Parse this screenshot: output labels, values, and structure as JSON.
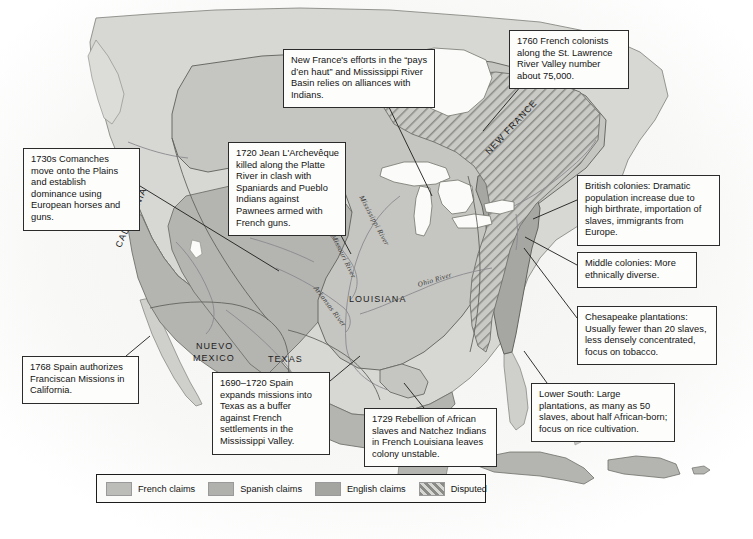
{
  "map": {
    "title": "Colonial North America c. 1700-1760",
    "background_color": "#ffffff",
    "ocean_color": "#f4f4f2",
    "unclaimed_land_color": "#d9d9d5",
    "colors": {
      "french_claims": "#bcbcb8",
      "spanish_claims": "#a8a8a4",
      "english_claims": "#9d9d99",
      "disputed_hatch": "#8f8f8b",
      "border_line": "#6e6e6a",
      "coast_line": "#7a7a76",
      "river_line": "#85858a"
    },
    "region_labels": [
      {
        "name": "CALIFORNIA",
        "text": "CALIFORNIA",
        "x": 118,
        "y": 242,
        "rotate": -66
      },
      {
        "name": "NUEVO MEXICO",
        "text": "NUEVO",
        "x": 196,
        "y": 341,
        "rotate": 0
      },
      {
        "name": "NUEVO MEXICO 2",
        "text": "MEXICO",
        "x": 193,
        "y": 353,
        "rotate": 0
      },
      {
        "name": "TEXAS",
        "text": "TEXAS",
        "x": 268,
        "y": 354,
        "rotate": 0
      },
      {
        "name": "LOUISIANA",
        "text": "LOUISIANA",
        "x": 349,
        "y": 294,
        "rotate": 0
      },
      {
        "name": "NEW FRANCE",
        "text": "NEW FRANCE",
        "x": 487,
        "y": 148,
        "rotate": -47
      }
    ],
    "river_labels": [
      {
        "name": "Mississippi River",
        "text": "Mississippi River",
        "x": 361,
        "y": 192,
        "rotate": 62
      },
      {
        "name": "Missouri River",
        "text": "Missouri River",
        "x": 333,
        "y": 231,
        "rotate": 64
      },
      {
        "name": "Ohio River",
        "text": "Ohio River",
        "x": 418,
        "y": 281,
        "rotate": -17
      },
      {
        "name": "Arkansas River",
        "text": "Arkansas River",
        "x": 315,
        "y": 283,
        "rotate": 53
      }
    ]
  },
  "callouts": [
    {
      "id": "comanches",
      "text": "1730s Comanches move onto the Plains and establish dominance using European horses and guns.",
      "x": 23,
      "y": 148,
      "width": 117,
      "height": 62
    },
    {
      "id": "larcheveque",
      "text": "1720 Jean L'Archevêque killed along the Platte River in clash with Spaniards and Pueblo Indians against Pawnees armed with French guns.",
      "x": 228,
      "y": 142,
      "width": 118,
      "height": 75
    },
    {
      "id": "new-france-efforts",
      "text": "New France's efforts in the  “pays d’en haut” and Mississippi River Basin relies on alliances with Indians.",
      "x": 283,
      "y": 49,
      "width": 152,
      "height": 54
    },
    {
      "id": "french-colonists-1760",
      "text": "1760 French colonists along the St. Lawrence River Valley number about 75,000.",
      "x": 509,
      "y": 30,
      "width": 120,
      "height": 56
    },
    {
      "id": "british-colonies",
      "text": "British colonies: Dramatic population increase due to high birthrate, importation of slaves, immigrants from Europe.",
      "x": 577,
      "y": 175,
      "width": 143,
      "height": 52
    },
    {
      "id": "middle-colonies",
      "text": "Middle colonies: More ethnically diverse.",
      "x": 577,
      "y": 252,
      "width": 120,
      "height": 30
    },
    {
      "id": "chesapeake",
      "text": "Chesapeake plantations: Usually fewer than 20 slaves, less densely concentrated, focus on tobacco.",
      "x": 577,
      "y": 306,
      "width": 140,
      "height": 52
    },
    {
      "id": "lower-south",
      "text": "Lower South: Large plantations, as many as 50 slaves, about half African-born; focus on rice cultivation.",
      "x": 531,
      "y": 383,
      "width": 144,
      "height": 52
    },
    {
      "id": "natchez-rebellion",
      "text": "1729 Rebellion of African slaves and Natchez Indians in French Louisiana leaves colony unstable.",
      "x": 364,
      "y": 408,
      "width": 133,
      "height": 50
    },
    {
      "id": "texas-missions",
      "text": "1690–1720 Spain expands missions into Texas as a buffer against French settlements in the Mississippi Valley.",
      "x": 212,
      "y": 372,
      "width": 118,
      "height": 62
    },
    {
      "id": "franciscan-missions",
      "text": "1768 Spain authorizes Franciscan Missions in California.",
      "x": 22,
      "y": 356,
      "width": 117,
      "height": 40
    }
  ],
  "leader_lines": [
    {
      "id": "comanches-leader",
      "x1": 140,
      "y1": 186,
      "x2": 279,
      "y2": 271
    },
    {
      "id": "larcheveque-leader",
      "x1": 331,
      "y1": 217,
      "x2": 351,
      "y2": 254
    },
    {
      "id": "new-france-leader",
      "x1": 387,
      "y1": 103,
      "x2": 432,
      "y2": 196
    },
    {
      "id": "french-colonists-leader",
      "x1": 521,
      "y1": 86,
      "x2": 483,
      "y2": 131
    },
    {
      "id": "british-colonies-leader",
      "x1": 577,
      "y1": 200,
      "x2": 533,
      "y2": 219
    },
    {
      "id": "middle-colonies-leader",
      "x1": 577,
      "y1": 265,
      "x2": 525,
      "y2": 237
    },
    {
      "id": "chesapeake-leader",
      "x1": 577,
      "y1": 318,
      "x2": 524,
      "y2": 248
    },
    {
      "id": "lower-south-leader",
      "x1": 547,
      "y1": 383,
      "x2": 524,
      "y2": 351
    },
    {
      "id": "natchez-leader",
      "x1": 424,
      "y1": 408,
      "x2": 404,
      "y2": 383
    },
    {
      "id": "texas-missions-leader",
      "x1": 330,
      "y1": 381,
      "x2": 360,
      "y2": 356
    },
    {
      "id": "franciscan-leader",
      "x1": 126,
      "y1": 356,
      "x2": 150,
      "y2": 336
    }
  ],
  "legend": {
    "entries": [
      {
        "label": "French claims",
        "pattern": "solid",
        "color": "#bcbcb8"
      },
      {
        "label": "Spanish claims",
        "pattern": "solid",
        "color": "#b0b0ac"
      },
      {
        "label": "English claims",
        "pattern": "solid",
        "color": "#a4a4a0"
      },
      {
        "label": "Disputed",
        "pattern": "hatch",
        "color": "#9a9a96"
      }
    ]
  }
}
